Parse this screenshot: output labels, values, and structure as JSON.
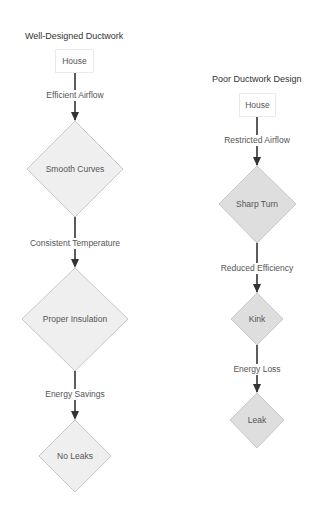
{
  "left": {
    "title": "Well-Designed Ductwork",
    "start": "House",
    "edges": [
      "Efficient Airflow",
      "Consistent Temperature",
      "Energy Savings"
    ],
    "nodes": [
      "Smooth Curves",
      "Proper Insulation",
      "No Leaks"
    ]
  },
  "right": {
    "title": "Poor Ductwork Design",
    "start": "House",
    "edges": [
      "Restricted Airflow",
      "Reduced Efficiency",
      "Energy Loss"
    ],
    "nodes": [
      "Sharp Turn",
      "Kink",
      "Leak"
    ]
  },
  "colors": {
    "good_fill": "#efefef",
    "poor_fill": "#dedede",
    "node_border": "#c8c8c8",
    "arrow": "#333333"
  }
}
